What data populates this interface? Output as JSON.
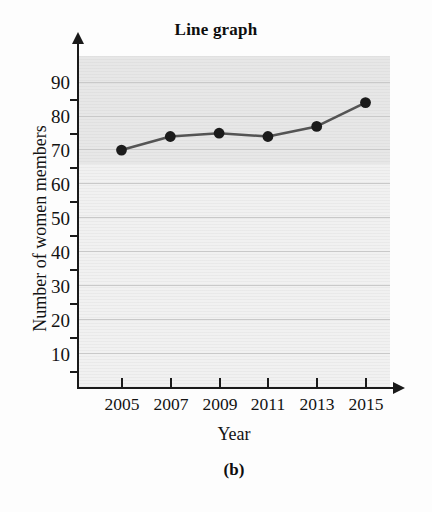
{
  "chart_data": {
    "type": "line",
    "title": "Line graph",
    "caption": "(b)",
    "xlabel": "Year",
    "ylabel": "Number of women members",
    "categories": [
      "2005",
      "2007",
      "2009",
      "2011",
      "2013",
      "2015"
    ],
    "x": [
      2005,
      2007,
      2009,
      2011,
      2013,
      2015
    ],
    "values": [
      70,
      74,
      75,
      74,
      77,
      84
    ],
    "series": [
      {
        "name": "Number of women members",
        "values": [
          70,
          74,
          75,
          74,
          77,
          84
        ]
      }
    ],
    "ylim": [
      0,
      95
    ],
    "xlim": [
      2004,
      2016
    ],
    "ytick_labels": [
      "10",
      "20",
      "30",
      "40",
      "50",
      "60",
      "70",
      "80",
      "90"
    ],
    "yticks": [
      10,
      20,
      30,
      40,
      50,
      60,
      70,
      80,
      90
    ],
    "xtick_labels": [
      "2005",
      "2007",
      "2009",
      "2011",
      "2013",
      "2015"
    ],
    "grid": true,
    "grid_axis": "y",
    "legend": false,
    "legend_position": "none",
    "marker": "circle",
    "colors": {
      "line": "#545454",
      "marker": "#1b1b1b",
      "grid": "#c9c9c9",
      "axis": "#1a1a1a",
      "plot_background": "#f1f1f1",
      "figure_background": "#fdfdfd",
      "text": "#131313"
    }
  }
}
